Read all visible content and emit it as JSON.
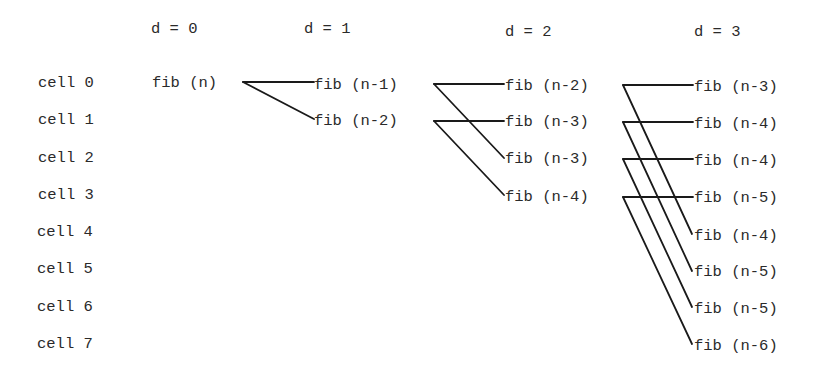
{
  "headers": [
    {
      "label": "d = 0",
      "x": 151,
      "y": 22
    },
    {
      "label": "d = 1",
      "x": 304,
      "y": 22
    },
    {
      "label": "d = 2",
      "x": 505,
      "y": 25
    },
    {
      "label": "d = 3",
      "x": 694,
      "y": 25
    }
  ],
  "cells": [
    {
      "label": "cell 0",
      "x": 38,
      "y": 76
    },
    {
      "label": "cell 1",
      "x": 38,
      "y": 113
    },
    {
      "label": "cell 2",
      "x": 38,
      "y": 151
    },
    {
      "label": "cell 3",
      "x": 38,
      "y": 188
    },
    {
      "label": "cell 4",
      "x": 37,
      "y": 225
    },
    {
      "label": "cell 5",
      "x": 37,
      "y": 262
    },
    {
      "label": "cell 6",
      "x": 37,
      "y": 300
    },
    {
      "label": "cell 7",
      "x": 37,
      "y": 337
    }
  ],
  "nodes": [
    {
      "label": "fib (n)",
      "depth": 0,
      "x": 152,
      "y": 76
    },
    {
      "label": "fib (n-1)",
      "depth": 1,
      "x": 314,
      "y": 78
    },
    {
      "label": "fib (n-2)",
      "depth": 1,
      "x": 314,
      "y": 114
    },
    {
      "label": "fib (n-2)",
      "depth": 2,
      "x": 505,
      "y": 79
    },
    {
      "label": "fib (n-3)",
      "depth": 2,
      "x": 505,
      "y": 115
    },
    {
      "label": "fib (n-3)",
      "depth": 2,
      "x": 505,
      "y": 152
    },
    {
      "label": "fib (n-4)",
      "depth": 2,
      "x": 505,
      "y": 190
    },
    {
      "label": "fib (n-3)",
      "depth": 3,
      "x": 694,
      "y": 80
    },
    {
      "label": "fib (n-4)",
      "depth": 3,
      "x": 694,
      "y": 117
    },
    {
      "label": "fib (n-4)",
      "depth": 3,
      "x": 694,
      "y": 154
    },
    {
      "label": "fib (n-5)",
      "depth": 3,
      "x": 694,
      "y": 191
    },
    {
      "label": "fib (n-4)",
      "depth": 3,
      "x": 694,
      "y": 229
    },
    {
      "label": "fib (n-5)",
      "depth": 3,
      "x": 694,
      "y": 265
    },
    {
      "label": "fib (n-5)",
      "depth": 3,
      "x": 694,
      "y": 302
    },
    {
      "label": "fib (n-6)",
      "depth": 3,
      "x": 694,
      "y": 339
    }
  ],
  "edges": [
    {
      "from": 0,
      "to": 1,
      "x1": 243,
      "y1": 82,
      "x2": 314,
      "y2": 82
    },
    {
      "from": 0,
      "to": 2,
      "x1": 243,
      "y1": 82,
      "x2": 314,
      "y2": 119
    },
    {
      "from": 1,
      "to": 3,
      "x1": 434,
      "y1": 84,
      "x2": 504,
      "y2": 84
    },
    {
      "from": 1,
      "to": 5,
      "x1": 434,
      "y1": 84,
      "x2": 504,
      "y2": 158
    },
    {
      "from": 2,
      "to": 4,
      "x1": 434,
      "y1": 121,
      "x2": 504,
      "y2": 121
    },
    {
      "from": 2,
      "to": 6,
      "x1": 434,
      "y1": 121,
      "x2": 504,
      "y2": 195
    },
    {
      "from": 3,
      "to": 7,
      "x1": 623,
      "y1": 85,
      "x2": 693,
      "y2": 85
    },
    {
      "from": 3,
      "to": 11,
      "x1": 623,
      "y1": 85,
      "x2": 692,
      "y2": 234
    },
    {
      "from": 4,
      "to": 8,
      "x1": 623,
      "y1": 122,
      "x2": 693,
      "y2": 122
    },
    {
      "from": 4,
      "to": 12,
      "x1": 623,
      "y1": 122,
      "x2": 692,
      "y2": 271
    },
    {
      "from": 5,
      "to": 9,
      "x1": 623,
      "y1": 159,
      "x2": 693,
      "y2": 159
    },
    {
      "from": 5,
      "to": 13,
      "x1": 623,
      "y1": 159,
      "x2": 692,
      "y2": 307
    },
    {
      "from": 6,
      "to": 10,
      "x1": 623,
      "y1": 197,
      "x2": 693,
      "y2": 197
    },
    {
      "from": 6,
      "to": 14,
      "x1": 623,
      "y1": 197,
      "x2": 692,
      "y2": 344
    }
  ]
}
